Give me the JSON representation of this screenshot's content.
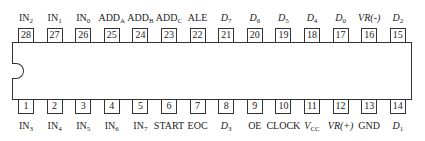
{
  "chip": {
    "pin_count": 28,
    "top_pins": [
      {
        "num": "28",
        "name": "IN",
        "sub": "2",
        "italic": false
      },
      {
        "num": "27",
        "name": "IN",
        "sub": "1",
        "italic": false
      },
      {
        "num": "26",
        "name": "IN",
        "sub": "0",
        "italic": false
      },
      {
        "num": "25",
        "name": "ADD",
        "sub": "A",
        "italic": false
      },
      {
        "num": "24",
        "name": "ADD",
        "sub": "B",
        "italic": false
      },
      {
        "num": "23",
        "name": "ADD",
        "sub": "C",
        "italic": false
      },
      {
        "num": "22",
        "name": "ALE",
        "sub": "",
        "italic": false
      },
      {
        "num": "21",
        "name": "D",
        "sub": "7",
        "italic": true
      },
      {
        "num": "20",
        "name": "D",
        "sub": "6",
        "italic": true
      },
      {
        "num": "19",
        "name": "D",
        "sub": "5",
        "italic": true
      },
      {
        "num": "18",
        "name": "D",
        "sub": "4",
        "italic": true
      },
      {
        "num": "17",
        "name": "D",
        "sub": "0",
        "italic": true
      },
      {
        "num": "16",
        "name": "VR(-)",
        "sub": "",
        "italic": true
      },
      {
        "num": "15",
        "name": "D",
        "sub": "2",
        "italic": true
      }
    ],
    "bottom_pins": [
      {
        "num": "1",
        "name": "IN",
        "sub": "3",
        "italic": false
      },
      {
        "num": "2",
        "name": "IN",
        "sub": "4",
        "italic": false
      },
      {
        "num": "3",
        "name": "IN",
        "sub": "5",
        "italic": false
      },
      {
        "num": "4",
        "name": "IN",
        "sub": "6",
        "italic": false
      },
      {
        "num": "5",
        "name": "IN",
        "sub": "7",
        "italic": false
      },
      {
        "num": "6",
        "name": "START",
        "sub": "",
        "italic": false
      },
      {
        "num": "7",
        "name": "EOC",
        "sub": "",
        "italic": false
      },
      {
        "num": "8",
        "name": "D",
        "sub": "3",
        "italic": true
      },
      {
        "num": "9",
        "name": "OE",
        "sub": "",
        "italic": false
      },
      {
        "num": "10",
        "name": "CLOCK",
        "sub": "",
        "italic": false
      },
      {
        "num": "11",
        "name": "V",
        "sub": "CC",
        "italic": true
      },
      {
        "num": "12",
        "name": "VR(+)",
        "sub": "",
        "italic": true
      },
      {
        "num": "13",
        "name": "GND",
        "sub": "",
        "italic": false
      },
      {
        "num": "14",
        "name": "D",
        "sub": "1",
        "italic": true
      }
    ]
  }
}
